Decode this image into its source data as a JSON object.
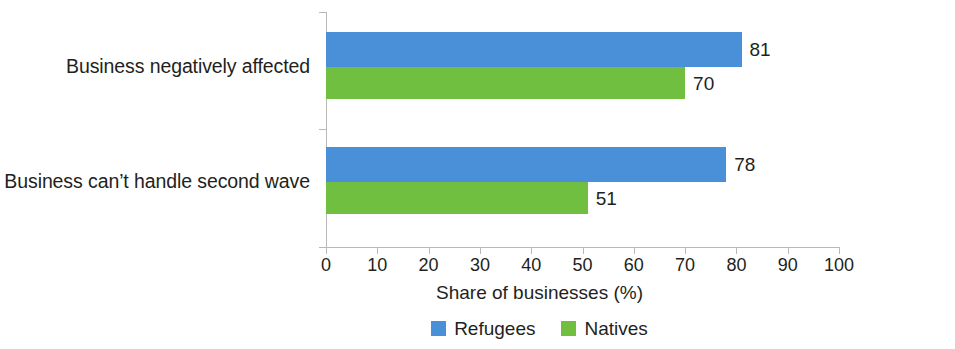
{
  "chart_data": {
    "type": "bar",
    "orientation": "horizontal",
    "title": "",
    "xlabel": "Share of businesses (%)",
    "ylabel": "",
    "xlim": [
      0,
      100
    ],
    "xticks": [
      0,
      10,
      20,
      30,
      40,
      50,
      60,
      70,
      80,
      90,
      100
    ],
    "xtick_labels": [
      "0",
      "10",
      "20",
      "30",
      "40",
      "50",
      "60",
      "70",
      "80",
      "90",
      "100"
    ],
    "grid": false,
    "legend_position": "bottom-center",
    "categories": [
      "Business negatively affected",
      "Business can’t handle second wave"
    ],
    "series": [
      {
        "name": "Refugees",
        "color": "#4a90d9",
        "values": [
          81,
          78
        ],
        "value_labels": [
          "81",
          "78"
        ]
      },
      {
        "name": "Natives",
        "color": "#70bf41",
        "values": [
          70,
          51
        ],
        "value_labels": [
          "70",
          "51"
        ]
      }
    ]
  },
  "axis": {
    "line_color": "#b8b8b8"
  }
}
